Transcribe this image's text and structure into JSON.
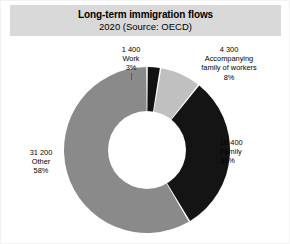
{
  "figure": {
    "title": "Long-term immigration flows",
    "subtitle": "2020 (Source: OECD)",
    "banner_color": "#d9d9d9",
    "background_color": "#ffffff"
  },
  "chart_data": {
    "type": "pie",
    "variant": "donut",
    "title": "Long-term immigration flows",
    "subtitle": "2020 (Source: OECD)",
    "source": "OECD",
    "year": "2020",
    "unit": "persons",
    "total": 53300,
    "start_angle_deg": 0,
    "direction": "clockwise",
    "inner_radius_ratio": 0.47,
    "legend": "none",
    "grid": false,
    "labels_position": "outside",
    "categories": [
      "Work",
      "Accompanying family of workers",
      "Family",
      "Other"
    ],
    "values": [
      1400,
      4300,
      16400,
      31200
    ],
    "percents": [
      3,
      8,
      31,
      58
    ],
    "value_labels": [
      "1 400",
      "4 300",
      "16 400",
      "31 200"
    ],
    "percent_labels": [
      "3%",
      "8%",
      "31%",
      "58%"
    ],
    "colors": [
      "#111111",
      "#c0c0c0",
      "#141414",
      "#8a8a8a"
    ],
    "slices": [
      {
        "name": "Work",
        "value": 1400,
        "value_label": "1 400",
        "percent": 3,
        "percent_label": "3%",
        "color": "#111111"
      },
      {
        "name": "Accompanying family of workers",
        "name_line1": "Accompanying",
        "name_line2": "family of workers",
        "value": 4300,
        "value_label": "4 300",
        "percent": 8,
        "percent_label": "8%",
        "color": "#c0c0c0"
      },
      {
        "name": "Family",
        "value": 16400,
        "value_label": "16 400",
        "percent": 31,
        "percent_label": "31%",
        "color": "#141414"
      },
      {
        "name": "Other",
        "value": 31200,
        "value_label": "31 200",
        "percent": 58,
        "percent_label": "58%",
        "color": "#8a8a8a"
      }
    ]
  }
}
